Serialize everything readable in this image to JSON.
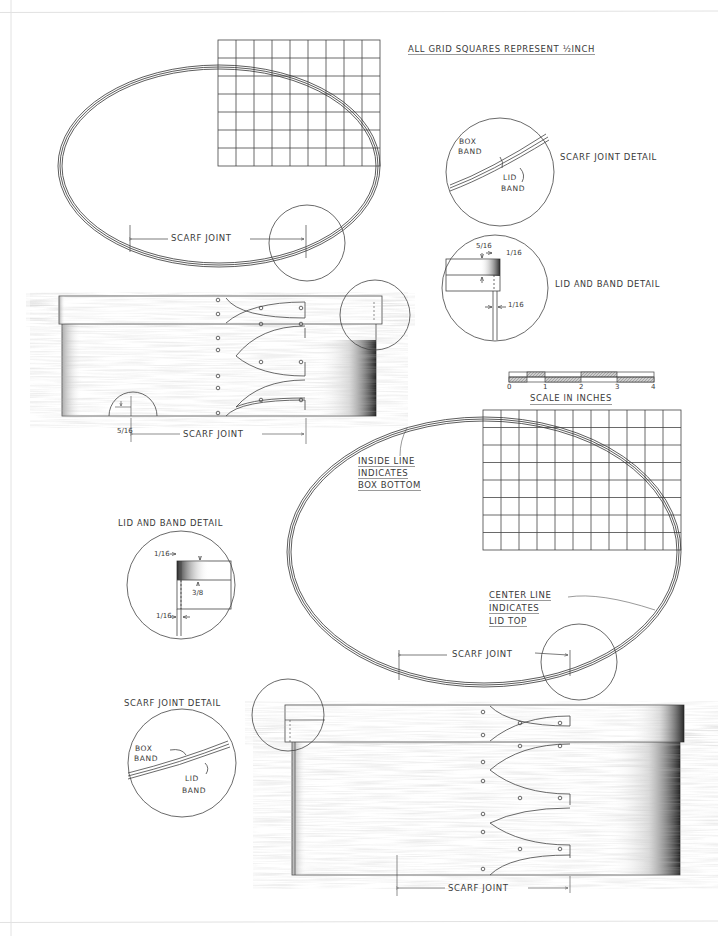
{
  "drawing": {
    "grid_note": {
      "text": "ALL GRID SQUARES REPRESENT",
      "fraction": "½",
      "unit": "INCH"
    },
    "scale": {
      "title_a": "SCALE",
      "title_b": "in",
      "title_c": "INCHES",
      "ticks": [
        "0",
        "1",
        "2",
        "3",
        "4"
      ]
    },
    "top_oval": {
      "grid": {
        "cols": 9,
        "rows": 7
      },
      "scarf_label": "SCARF JOINT"
    },
    "top_scarf_detail": {
      "title": "SCARF JOINT DETAIL",
      "box_band_1": "BOX",
      "box_band_2": "BAND",
      "lid_band_1": "LID",
      "lid_band_2": "BAND"
    },
    "top_lid_detail": {
      "title_a": "LID",
      "title_b": "and",
      "title_c": "BAND DETAIL",
      "dim_top_left": "5/16",
      "dim_top_right": "1/16",
      "dim_bottom": "1/16"
    },
    "top_box_side": {
      "scarf_label": "SCARF JOINT",
      "dim_corner": "5/16"
    },
    "bottom_oval": {
      "grid": {
        "cols": 11,
        "rows": 8
      },
      "scarf_label": "SCARF JOINT",
      "inside_note": [
        "INSIDE LINE",
        "INDICATES",
        "BOX BOTTOM"
      ],
      "center_note": [
        "CENTER LINE",
        "INDICATES",
        "LID TOP"
      ]
    },
    "bottom_lid_detail": {
      "title_a": "LID",
      "title_b": "and",
      "title_c": "BAND DETAIL",
      "dim_top": "1/16",
      "dim_height": "3/8",
      "dim_bottom": "1/16"
    },
    "bottom_scarf_detail": {
      "title": "SCARF JOINT DETAIL",
      "box_band_1": "BOX",
      "box_band_2": "BAND",
      "lid_band_1": "LID",
      "lid_band_2": "BAND"
    },
    "bottom_box_side": {
      "scarf_label": "SCARF JOINT"
    }
  }
}
